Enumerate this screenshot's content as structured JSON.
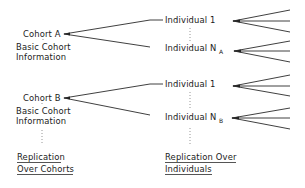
{
  "diagram": {
    "cohorts": [
      {
        "id": "A",
        "label": "Cohort A",
        "info_line1": "Basic Cohort",
        "info_line2": "Information",
        "individuals": [
          {
            "label": "Individual 1",
            "subscript": ""
          },
          {
            "label": "Individual N",
            "subscript": "A"
          }
        ]
      },
      {
        "id": "B",
        "label": "Cohort B",
        "info_line1": "Basic Cohort",
        "info_line2": "Information",
        "individuals": [
          {
            "label": "Individual 1",
            "subscript": ""
          },
          {
            "label": "Individual N",
            "subscript": "B"
          }
        ]
      }
    ],
    "footer": {
      "left_line1": "Replication",
      "left_line2": "Over Cohorts",
      "right_line1": "Replication Over",
      "right_line2": "Individuals"
    },
    "colors": {
      "ink": "#1a1a1a",
      "background": "#ffffff",
      "dots": "#8a8a8a"
    }
  }
}
